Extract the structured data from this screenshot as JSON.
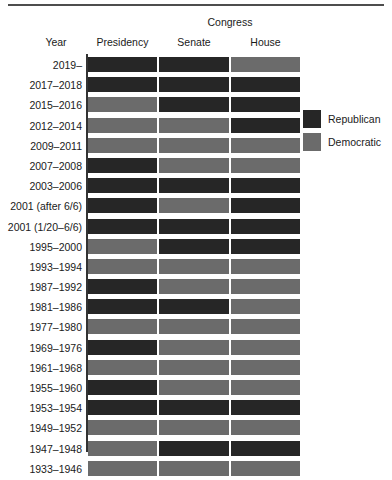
{
  "chart_data": {
    "type": "heatmap",
    "title": "",
    "xlabel": "",
    "ylabel": "Year",
    "group_header": "Congress",
    "year_header": "Year",
    "categories": [
      "Presidency",
      "Senate",
      "House"
    ],
    "grid": false,
    "legend_position": "right",
    "legend": [
      {
        "name": "Republican",
        "color": "#262626"
      },
      {
        "name": "Democratic",
        "color": "#6b6b6b"
      }
    ],
    "value_colors": {
      "Republican": "#262626",
      "Democratic": "#6b6b6b"
    },
    "rows": [
      {
        "year": "2019–",
        "values": [
          "Republican",
          "Republican",
          "Democratic"
        ]
      },
      {
        "year": "2017–2018",
        "values": [
          "Republican",
          "Republican",
          "Republican"
        ]
      },
      {
        "year": "2015–2016",
        "values": [
          "Democratic",
          "Republican",
          "Republican"
        ]
      },
      {
        "year": "2012–2014",
        "values": [
          "Democratic",
          "Democratic",
          "Republican"
        ]
      },
      {
        "year": "2009–2011",
        "values": [
          "Democratic",
          "Democratic",
          "Democratic"
        ]
      },
      {
        "year": "2007–2008",
        "values": [
          "Republican",
          "Democratic",
          "Democratic"
        ]
      },
      {
        "year": "2003–2006",
        "values": [
          "Republican",
          "Republican",
          "Republican"
        ]
      },
      {
        "year": "2001 (after 6/6)",
        "values": [
          "Republican",
          "Democratic",
          "Republican"
        ]
      },
      {
        "year": "2001 (1/20–6/6)",
        "values": [
          "Republican",
          "Republican",
          "Republican"
        ]
      },
      {
        "year": "1995–2000",
        "values": [
          "Democratic",
          "Republican",
          "Republican"
        ]
      },
      {
        "year": "1993–1994",
        "values": [
          "Democratic",
          "Democratic",
          "Democratic"
        ]
      },
      {
        "year": "1987–1992",
        "values": [
          "Republican",
          "Democratic",
          "Democratic"
        ]
      },
      {
        "year": "1981–1986",
        "values": [
          "Republican",
          "Republican",
          "Democratic"
        ]
      },
      {
        "year": "1977–1980",
        "values": [
          "Democratic",
          "Democratic",
          "Democratic"
        ]
      },
      {
        "year": "1969–1976",
        "values": [
          "Republican",
          "Democratic",
          "Democratic"
        ]
      },
      {
        "year": "1961–1968",
        "values": [
          "Democratic",
          "Democratic",
          "Democratic"
        ]
      },
      {
        "year": "1955–1960",
        "values": [
          "Republican",
          "Democratic",
          "Democratic"
        ]
      },
      {
        "year": "1953–1954",
        "values": [
          "Republican",
          "Republican",
          "Republican"
        ]
      },
      {
        "year": "1949–1952",
        "values": [
          "Democratic",
          "Democratic",
          "Democratic"
        ]
      },
      {
        "year": "1947–1948",
        "values": [
          "Democratic",
          "Republican",
          "Republican"
        ]
      },
      {
        "year": "1933–1946",
        "values": [
          "Democratic",
          "Democratic",
          "Democratic"
        ]
      }
    ]
  }
}
